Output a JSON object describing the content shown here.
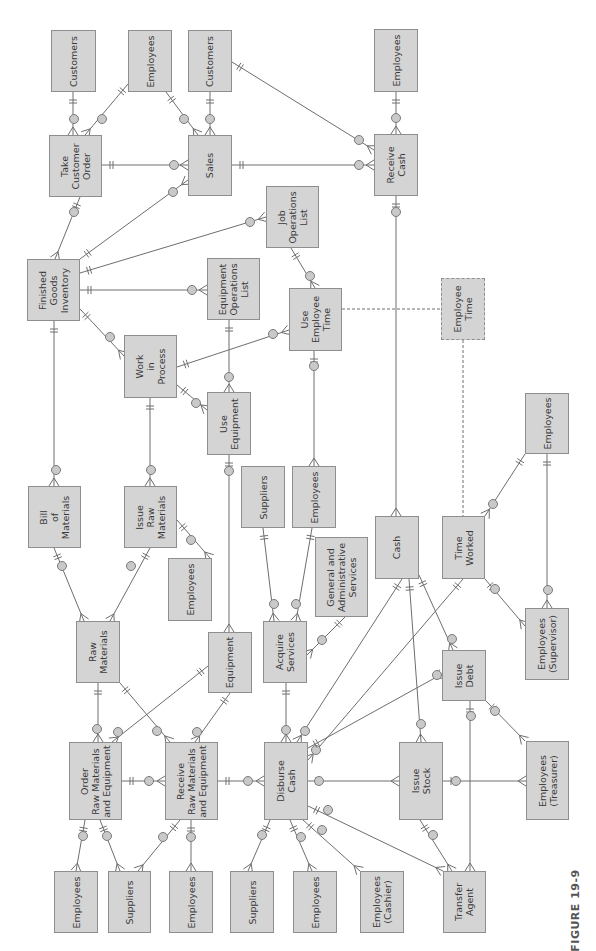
{
  "figure": {
    "caption": "FIGURE 19-9",
    "orientation": "rotated 90° counter-clockwise",
    "colors": {
      "entity_fill": "#d4d4d4",
      "entity_border": "#8e8e8e",
      "line": "#6e6e6e",
      "circle": "#c9c9c9"
    }
  },
  "entities": [
    {
      "id": "customers_1",
      "label": "Customers",
      "x": 51,
      "y": 30,
      "w": 45,
      "h": 62
    },
    {
      "id": "employees_tco",
      "label": "Employees",
      "x": 128,
      "y": 30,
      "w": 44,
      "h": 62
    },
    {
      "id": "customers_2",
      "label": "Customers",
      "x": 188,
      "y": 30,
      "w": 44,
      "h": 62
    },
    {
      "id": "employees_rc",
      "label": "Employees",
      "x": 374,
      "y": 29,
      "w": 44,
      "h": 63
    },
    {
      "id": "take_customer_order",
      "label": "Take\nCustomer\nOrder",
      "x": 49,
      "y": 135,
      "w": 53,
      "h": 62
    },
    {
      "id": "sales",
      "label": "Sales",
      "x": 188,
      "y": 135,
      "w": 44,
      "h": 61
    },
    {
      "id": "receive_cash",
      "label": "Receive\nCash",
      "x": 374,
      "y": 134,
      "w": 44,
      "h": 62
    },
    {
      "id": "job_operations_list",
      "label": "Job\nOperations\nList",
      "x": 266,
      "y": 186,
      "w": 53,
      "h": 62
    },
    {
      "id": "finished_goods_inventory",
      "label": "Finished\nGoods\nInventory",
      "x": 27,
      "y": 259,
      "w": 53,
      "h": 62
    },
    {
      "id": "equipment_operations_list",
      "label": "Equipment\nOperations\nList",
      "x": 207,
      "y": 258,
      "w": 53,
      "h": 62
    },
    {
      "id": "use_employee_time",
      "label": "Use\nEmployee\nTime",
      "x": 289,
      "y": 288,
      "w": 53,
      "h": 63
    },
    {
      "id": "employee_time",
      "label": "Employee\nTime",
      "x": 441,
      "y": 278,
      "w": 44,
      "h": 62,
      "dashed": true
    },
    {
      "id": "work_in_process",
      "label": "Work\nin\nProcess",
      "x": 124,
      "y": 335,
      "w": 53,
      "h": 63
    },
    {
      "id": "use_equipment",
      "label": "Use\nEquipment",
      "x": 207,
      "y": 392,
      "w": 44,
      "h": 63
    },
    {
      "id": "bill_of_materials",
      "label": "Bill\nof\nMaterials",
      "x": 28,
      "y": 486,
      "w": 53,
      "h": 62
    },
    {
      "id": "issue_raw_materials",
      "label": "Issue\nRaw\nMaterials",
      "x": 124,
      "y": 486,
      "w": 53,
      "h": 62
    },
    {
      "id": "employees_irm",
      "label": "Employees",
      "x": 168,
      "y": 558,
      "w": 44,
      "h": 63
    },
    {
      "id": "suppliers_as",
      "label": "Suppliers",
      "x": 241,
      "y": 466,
      "w": 44,
      "h": 62
    },
    {
      "id": "employees_as",
      "label": "Employees",
      "x": 292,
      "y": 466,
      "w": 44,
      "h": 62
    },
    {
      "id": "gen_admin_services",
      "label": "General and\nAdministrative\nServices",
      "x": 315,
      "y": 537,
      "w": 53,
      "h": 80
    },
    {
      "id": "cash",
      "label": "Cash",
      "x": 375,
      "y": 516,
      "w": 44,
      "h": 63
    },
    {
      "id": "time_worked",
      "label": "Time\nWorked",
      "x": 442,
      "y": 516,
      "w": 43,
      "h": 63
    },
    {
      "id": "employees_tw",
      "label": "Employees",
      "x": 525,
      "y": 393,
      "w": 44,
      "h": 61
    },
    {
      "id": "raw_materials",
      "label": "Raw\nMaterials",
      "x": 76,
      "y": 621,
      "w": 44,
      "h": 62
    },
    {
      "id": "equipment",
      "label": "Equipment",
      "x": 208,
      "y": 632,
      "w": 44,
      "h": 61
    },
    {
      "id": "acquire_services",
      "label": "Acquire\nServices",
      "x": 263,
      "y": 621,
      "w": 44,
      "h": 62
    },
    {
      "id": "employees_supervisor",
      "label": "Employees\n(Supervisor)",
      "x": 525,
      "y": 608,
      "w": 44,
      "h": 72
    },
    {
      "id": "issue_debt",
      "label": "Issue\nDebt",
      "x": 442,
      "y": 650,
      "w": 44,
      "h": 51
    },
    {
      "id": "order_rm_eq",
      "label": "Order\nRaw Materials\nand Equipment",
      "x": 69,
      "y": 742,
      "w": 53,
      "h": 78
    },
    {
      "id": "receive_rm_eq",
      "label": "Receive\nRaw Materials\nand Equipment",
      "x": 165,
      "y": 742,
      "w": 53,
      "h": 78
    },
    {
      "id": "disburse_cash",
      "label": "Disburse\nCash",
      "x": 264,
      "y": 742,
      "w": 44,
      "h": 78
    },
    {
      "id": "issue_stock",
      "label": "Issue\nStock",
      "x": 399,
      "y": 742,
      "w": 44,
      "h": 78
    },
    {
      "id": "employees_treasurer",
      "label": "Employees\n(Treasurer)",
      "x": 526,
      "y": 741,
      "w": 43,
      "h": 79
    },
    {
      "id": "employees_b1",
      "label": "Employees",
      "x": 54,
      "y": 871,
      "w": 44,
      "h": 62
    },
    {
      "id": "suppliers_b1",
      "label": "Suppliers",
      "x": 108,
      "y": 871,
      "w": 43,
      "h": 62
    },
    {
      "id": "employees_b2",
      "label": "Employees",
      "x": 169,
      "y": 871,
      "w": 44,
      "h": 62
    },
    {
      "id": "suppliers_b2",
      "label": "Suppliers",
      "x": 230,
      "y": 871,
      "w": 44,
      "h": 62
    },
    {
      "id": "employees_b3",
      "label": "Employees",
      "x": 293,
      "y": 871,
      "w": 44,
      "h": 62
    },
    {
      "id": "employees_cashier",
      "label": "Employees\n(Cashier)",
      "x": 360,
      "y": 871,
      "w": 44,
      "h": 62
    },
    {
      "id": "transfer_agent",
      "label": "Transfer\nAgent",
      "x": 443,
      "y": 871,
      "w": 43,
      "h": 62
    }
  ],
  "relationships": [
    {
      "from": "customers_1",
      "to": "take_customer_order",
      "line": [
        73,
        92,
        73,
        135
      ],
      "circle": [
        74,
        119
      ]
    },
    {
      "from": "employees_tco",
      "to": "take_customer_order",
      "line": [
        128,
        84,
        85,
        135
      ],
      "circle": [
        102,
        119
      ]
    },
    {
      "from": "employees_tco",
      "to": "sales",
      "line": [
        166,
        92,
        198,
        135
      ],
      "circle": [
        184,
        119
      ]
    },
    {
      "from": "customers_2",
      "to": "sales",
      "line": [
        210,
        92,
        210,
        135
      ],
      "circle": [
        210,
        119
      ]
    },
    {
      "from": "customers_2",
      "to": "receive_cash",
      "line": [
        232,
        62,
        374,
        150
      ],
      "circle": [
        359,
        140
      ]
    },
    {
      "from": "employees_rc",
      "to": "receive_cash",
      "line": [
        396,
        92,
        396,
        134
      ],
      "circle": [
        396,
        118
      ]
    },
    {
      "from": "take_customer_order",
      "to": "sales",
      "line": [
        102,
        165,
        188,
        165
      ],
      "circle": [
        174,
        165
      ]
    },
    {
      "from": "sales",
      "to": "receive_cash",
      "line": [
        232,
        165,
        374,
        165
      ],
      "circle": [
        359,
        165
      ]
    },
    {
      "from": "take_customer_order",
      "to": "finished_goods_inventory",
      "line": [
        80,
        197,
        55,
        259
      ],
      "circle": [
        74,
        212
      ]
    },
    {
      "from": "finished_goods_inventory",
      "to": "sales",
      "line": [
        80,
        259,
        188,
        180
      ],
      "circle": [
        173,
        192
      ]
    },
    {
      "from": "finished_goods_inventory",
      "to": "job_operations_list",
      "line": [
        80,
        273,
        266,
        217
      ],
      "circle": [
        250,
        222
      ]
    },
    {
      "from": "finished_goods_inventory",
      "to": "equipment_operations_list",
      "line": [
        80,
        290,
        207,
        290
      ],
      "circle": [
        192,
        290
      ]
    },
    {
      "from": "finished_goods_inventory",
      "to": "work_in_process",
      "line": [
        80,
        309,
        124,
        356
      ],
      "circle": [
        110,
        337
      ]
    },
    {
      "from": "finished_goods_inventory",
      "to": "bill_of_materials",
      "line": [
        54,
        321,
        54,
        486
      ],
      "circle": [
        56,
        470
      ]
    },
    {
      "from": "job_operations_list",
      "to": "use_employee_time",
      "line": [
        291,
        248,
        315,
        288
      ],
      "circle": [
        310,
        276
      ]
    },
    {
      "from": "equipment_operations_list",
      "to": "use_equipment",
      "line": [
        229,
        320,
        229,
        392
      ],
      "circle": [
        229,
        377
      ]
    },
    {
      "from": "work_in_process",
      "to": "use_employee_time",
      "line": [
        177,
        367,
        289,
        330
      ],
      "circle": [
        273,
        334
      ]
    },
    {
      "from": "work_in_process",
      "to": "use_equipment",
      "line": [
        177,
        385,
        207,
        410
      ],
      "circle": [
        196,
        403
      ]
    },
    {
      "from": "work_in_process",
      "to": "issue_raw_materials",
      "line": [
        150,
        398,
        150,
        486
      ],
      "circle": [
        151,
        470
      ]
    },
    {
      "from": "receive_cash",
      "to": "cash",
      "line": [
        396,
        196,
        396,
        516
      ],
      "circle": [
        396,
        212
      ]
    },
    {
      "from": "use_employee_time",
      "to": "employees_as",
      "line": [
        314,
        351,
        314,
        466
      ],
      "circle": [
        314,
        366
      ]
    },
    {
      "from": "use_equipment",
      "to": "equipment",
      "line": [
        229,
        455,
        229,
        632
      ],
      "circle": [
        229,
        471
      ]
    },
    {
      "from": "bill_of_materials",
      "to": "raw_materials",
      "line": [
        54,
        548,
        84,
        621
      ],
      "circle": [
        62,
        566
      ]
    },
    {
      "from": "issue_raw_materials",
      "to": "raw_materials",
      "line": [
        150,
        548,
        110,
        621
      ],
      "circle": [
        131,
        566
      ]
    },
    {
      "from": "issue_raw_materials",
      "to": "employees_irm",
      "line": [
        177,
        520,
        210,
        558
      ],
      "circle": [
        191,
        540
      ]
    },
    {
      "from": "suppliers_as",
      "to": "acquire_services",
      "line": [
        263,
        528,
        274,
        621
      ],
      "circle": [
        274,
        604
      ]
    },
    {
      "from": "employees_as",
      "to": "acquire_services",
      "line": [
        312,
        528,
        296,
        621
      ],
      "circle": [
        296,
        604
      ]
    },
    {
      "from": "gen_admin_services",
      "to": "acquire_services",
      "line": [
        345,
        617,
        307,
        655
      ],
      "circle": [
        322,
        640
      ]
    },
    {
      "from": "employees_tw",
      "to": "time_worked",
      "line": [
        525,
        454,
        485,
        516
      ],
      "circle": [
        493,
        504
      ]
    },
    {
      "from": "employees_tw",
      "to": "employees_supervisor",
      "line": [
        547,
        454,
        547,
        608
      ],
      "circle": [
        548,
        590
      ]
    },
    {
      "from": "time_worked",
      "to": "employees_supervisor",
      "line": [
        485,
        579,
        525,
        626
      ],
      "circle": [
        495,
        589
      ]
    },
    {
      "from": "raw_materials",
      "to": "order_rm_eq",
      "line": [
        98,
        683,
        98,
        742
      ],
      "circle": [
        97,
        729
      ]
    },
    {
      "from": "raw_materials",
      "to": "receive_rm_eq",
      "line": [
        120,
        683,
        170,
        742
      ],
      "circle": [
        157,
        731
      ]
    },
    {
      "from": "equipment",
      "to": "order_rm_eq",
      "line": [
        208,
        666,
        112,
        742
      ],
      "circle": [
        118,
        732
      ]
    },
    {
      "from": "equipment",
      "to": "receive_rm_eq",
      "line": [
        230,
        693,
        195,
        742
      ],
      "circle": [
        197,
        732
      ]
    },
    {
      "from": "acquire_services",
      "to": "disburse_cash",
      "line": [
        286,
        683,
        286,
        742
      ],
      "circle": [
        286,
        730
      ]
    },
    {
      "from": "order_rm_eq",
      "to": "receive_rm_eq",
      "line": [
        122,
        781,
        165,
        781
      ],
      "circle": [
        149,
        781
      ]
    },
    {
      "from": "receive_rm_eq",
      "to": "disburse_cash",
      "line": [
        218,
        781,
        264,
        781
      ],
      "circle": [
        248,
        781
      ]
    },
    {
      "from": "cash",
      "to": "disburse_cash",
      "line": [
        402,
        579,
        297,
        742
      ],
      "circle": [
        305,
        731
      ]
    },
    {
      "from": "time_worked",
      "to": "disburse_cash",
      "line": [
        463,
        579,
        308,
        760
      ],
      "circle": [
        316,
        750
      ]
    },
    {
      "from": "cash",
      "to": "issue_stock",
      "line": [
        409,
        579,
        421,
        742
      ],
      "circle": [
        421,
        724
      ]
    },
    {
      "from": "cash",
      "to": "issue_debt",
      "line": [
        419,
        575,
        453,
        650
      ],
      "circle": [
        452,
        639
      ]
    },
    {
      "from": "disburse_cash",
      "to": "issue_debt",
      "line": [
        308,
        748,
        442,
        674
      ],
      "circle": [
        437,
        675
      ]
    },
    {
      "from": "disburse_cash",
      "to": "issue_stock",
      "line": [
        308,
        781,
        399,
        781
      ],
      "circle": [
        319,
        781
      ]
    },
    {
      "from": "issue_debt",
      "to": "transfer_agent",
      "line": [
        470,
        701,
        470,
        871
      ],
      "circle": [
        471,
        716
      ]
    },
    {
      "from": "issue_debt",
      "to": "employees_treasurer",
      "line": [
        486,
        701,
        525,
        741
      ],
      "circle": [
        495,
        711
      ]
    },
    {
      "from": "issue_stock",
      "to": "employees_treasurer",
      "line": [
        443,
        781,
        526,
        781
      ],
      "circle": [
        456,
        781
      ]
    },
    {
      "from": "issue_stock",
      "to": "transfer_agent",
      "line": [
        420,
        820,
        452,
        871
      ],
      "circle": [
        433,
        835
      ]
    },
    {
      "from": "disburse_cash",
      "to": "transfer_agent",
      "line": [
        308,
        806,
        443,
        871
      ],
      "circle": [
        328,
        810
      ]
    },
    {
      "from": "disburse_cash",
      "to": "employees_cashier",
      "line": [
        303,
        820,
        360,
        871
      ],
      "circle": [
        322,
        830
      ]
    },
    {
      "from": "disburse_cash",
      "to": "employees_b3",
      "line": [
        290,
        820,
        312,
        871
      ],
      "circle": [
        301,
        837
      ]
    },
    {
      "from": "disburse_cash",
      "to": "suppliers_b2",
      "line": [
        270,
        820,
        248,
        871
      ],
      "circle": [
        262,
        835
      ]
    },
    {
      "from": "order_rm_eq",
      "to": "employees_b1",
      "line": [
        85,
        820,
        76,
        871
      ],
      "circle": [
        83,
        836
      ]
    },
    {
      "from": "order_rm_eq",
      "to": "suppliers_b1",
      "line": [
        100,
        820,
        120,
        871
      ],
      "circle": [
        107,
        836
      ]
    },
    {
      "from": "receive_rm_eq",
      "to": "suppliers_b1",
      "line": [
        180,
        820,
        138,
        871
      ],
      "circle": [
        163,
        837
      ]
    },
    {
      "from": "receive_rm_eq",
      "to": "employees_b2",
      "line": [
        191,
        820,
        191,
        871
      ],
      "circle": [
        191,
        837
      ]
    }
  ],
  "dashed_links": [
    {
      "from": "use_employee_time",
      "to": "employee_time",
      "line": [
        342,
        309,
        441,
        309
      ]
    },
    {
      "from": "employee_time",
      "to": "time_worked",
      "line": [
        463,
        340,
        463,
        516
      ]
    }
  ]
}
